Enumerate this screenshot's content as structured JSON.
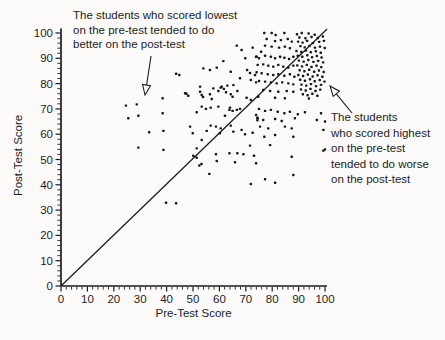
{
  "figure": {
    "background": "#fcfbfa",
    "ink_color": "#1c1c1c",
    "dot_color": "#161616"
  },
  "annotations": {
    "left": {
      "lines": [
        "The students who scored lowest",
        "on the pre-test tended to do",
        "better on the post-test"
      ],
      "arrow_icon": "open-arrowhead-down-left"
    },
    "right": {
      "lines": [
        "The students",
        "who scored highest",
        "on the pre-test",
        "tended to do worse",
        "on the post-test"
      ],
      "arrow_icon": "open-arrowhead-up-left"
    }
  },
  "chart_data": {
    "type": "scatter",
    "title": "",
    "xlabel": "Pre-Test Score",
    "ylabel": "Post-Test Score",
    "xlim": [
      0,
      100
    ],
    "ylim": [
      0,
      100
    ],
    "x_ticks": [
      0,
      10,
      20,
      30,
      40,
      50,
      60,
      70,
      80,
      90,
      100
    ],
    "y_ticks": [
      0,
      10,
      20,
      30,
      40,
      50,
      60,
      70,
      80,
      90,
      100
    ],
    "minor_tick_step": 2,
    "grid": false,
    "legend": "none",
    "identity_line": {
      "from": [
        0,
        0
      ],
      "to": [
        100.8,
        101.6
      ]
    },
    "points": [
      [
        66.6,
        95
      ],
      [
        68.4,
        93.3
      ],
      [
        72.6,
        94.2
      ],
      [
        61.5,
        88.9
      ],
      [
        69.8,
        90
      ],
      [
        73.9,
        90.6
      ],
      [
        53.9,
        86
      ],
      [
        56.4,
        85.4
      ],
      [
        59,
        86.3
      ],
      [
        64.3,
        84.7
      ],
      [
        70.5,
        85.4
      ],
      [
        71.6,
        84.2
      ],
      [
        73.5,
        83.4
      ],
      [
        67.8,
        82.1
      ],
      [
        71.9,
        81.4
      ],
      [
        73.9,
        80.5
      ],
      [
        52.7,
        78.8
      ],
      [
        57.7,
        78.1
      ],
      [
        60.9,
        78.8
      ],
      [
        63,
        79.2
      ],
      [
        65.3,
        79.4
      ],
      [
        47,
        76.2
      ],
      [
        52.7,
        76.8
      ],
      [
        44.8,
        83.4
      ],
      [
        43.6,
        83.9
      ],
      [
        28.7,
        71.8
      ],
      [
        24.6,
        71.3
      ],
      [
        38.5,
        74.2
      ],
      [
        47.5,
        76
      ],
      [
        48.2,
        75.2
      ],
      [
        53.3,
        75.5
      ],
      [
        53.8,
        74.7
      ],
      [
        56.4,
        75.8
      ],
      [
        59.6,
        77.1
      ],
      [
        60.5,
        78.4
      ],
      [
        61.7,
        77.9
      ],
      [
        62.5,
        76.6
      ],
      [
        64.3,
        75.8
      ],
      [
        65,
        74.8
      ],
      [
        66.8,
        77.1
      ],
      [
        25.5,
        66.3
      ],
      [
        29.3,
        67.3
      ],
      [
        38.5,
        68.3
      ],
      [
        51.4,
        68.7
      ],
      [
        54.9,
        70
      ],
      [
        56.7,
        70.5
      ],
      [
        59.6,
        70.9
      ],
      [
        64,
        70.5
      ],
      [
        66.6,
        69.6
      ],
      [
        33.4,
        60.8
      ],
      [
        38.8,
        61.3
      ],
      [
        49.9,
        60.4
      ],
      [
        55.2,
        61.3
      ],
      [
        60.2,
        60.4
      ],
      [
        65.3,
        61
      ],
      [
        29.3,
        54.7
      ],
      [
        38.8,
        53.8
      ],
      [
        51.4,
        54.4
      ],
      [
        66.8,
        52.5
      ],
      [
        52.4,
        47.6
      ],
      [
        53.2,
        48.2
      ],
      [
        59,
        49.4
      ],
      [
        65.9,
        48.9
      ],
      [
        57.1,
        73.9
      ],
      [
        70.3,
        74.4
      ],
      [
        71.9,
        73.5
      ],
      [
        53.3,
        70.9
      ],
      [
        63.8,
        69.6
      ],
      [
        65,
        69.2
      ],
      [
        67.8,
        70
      ],
      [
        62.1,
        67.3
      ],
      [
        48.9,
        63
      ],
      [
        56.7,
        63.4
      ],
      [
        58.7,
        63
      ],
      [
        60.5,
        62.3
      ],
      [
        64.3,
        63.4
      ],
      [
        68.4,
        61.7
      ],
      [
        69.7,
        60
      ],
      [
        72.6,
        60.6
      ],
      [
        53.3,
        57.7
      ],
      [
        71.6,
        55.5
      ],
      [
        58.7,
        52.1
      ],
      [
        63.8,
        52.5
      ],
      [
        69.1,
        52.1
      ],
      [
        73.1,
        51.5
      ],
      [
        50.1,
        51.5
      ],
      [
        51.4,
        50.7
      ],
      [
        73.9,
        48.5
      ],
      [
        56.2,
        44.3
      ],
      [
        39.8,
        32.9
      ],
      [
        43.6,
        32.7
      ],
      [
        71.9,
        40.3
      ],
      [
        77.3,
        42.2
      ],
      [
        81.1,
        40.8
      ],
      [
        88,
        43.9
      ],
      [
        75,
        70
      ],
      [
        77.3,
        69.2
      ],
      [
        79.5,
        69.6
      ],
      [
        82.1,
        68.9
      ],
      [
        84.6,
        68.3
      ],
      [
        86.7,
        68.9
      ],
      [
        89.7,
        67.9
      ],
      [
        92.4,
        68.7
      ],
      [
        74.5,
        66.3
      ],
      [
        76.6,
        65.6
      ],
      [
        81.1,
        66
      ],
      [
        83.6,
        65.2
      ],
      [
        88.6,
        66.3
      ],
      [
        96.9,
        65.6
      ],
      [
        100,
        65
      ],
      [
        75.4,
        63
      ],
      [
        78.5,
        62.3
      ],
      [
        84.8,
        63
      ],
      [
        87.4,
        62.3
      ],
      [
        99.4,
        61.7
      ],
      [
        77,
        59
      ],
      [
        81.1,
        59.7
      ],
      [
        88,
        59
      ],
      [
        79.2,
        55.7
      ],
      [
        87.4,
        51.1
      ],
      [
        98.5,
        68.3
      ],
      [
        99.4,
        53.5
      ],
      [
        100,
        54
      ],
      [
        73.9,
        67.6
      ],
      [
        74.4,
        66.5
      ],
      [
        74.4,
        65.5
      ],
      [
        79.8,
        100
      ],
      [
        84.6,
        100
      ],
      [
        77,
        100
      ],
      [
        81.3,
        99.2
      ],
      [
        77.9,
        97.6
      ],
      [
        81.1,
        96.8
      ],
      [
        83.3,
        97.2
      ],
      [
        85.9,
        97.6
      ],
      [
        87.4,
        96.6
      ],
      [
        77.3,
        95
      ],
      [
        79.8,
        94.6
      ],
      [
        82.6,
        94.2
      ],
      [
        84.8,
        94.6
      ],
      [
        86.7,
        94
      ],
      [
        75.8,
        92.6
      ],
      [
        74.1,
        90.6
      ],
      [
        75,
        90
      ],
      [
        77.3,
        91
      ],
      [
        79.5,
        90.6
      ],
      [
        81.1,
        90
      ],
      [
        83,
        90.6
      ],
      [
        84.6,
        90.2
      ],
      [
        86.4,
        89.7
      ],
      [
        88,
        90.6
      ],
      [
        74.5,
        87.4
      ],
      [
        76.6,
        87.6
      ],
      [
        78.5,
        87.1
      ],
      [
        80.4,
        86.7
      ],
      [
        82.3,
        87.4
      ],
      [
        84.2,
        86.7
      ],
      [
        86.1,
        86.3
      ],
      [
        88,
        87.1
      ],
      [
        74.1,
        84.5
      ],
      [
        76,
        84.1
      ],
      [
        78.3,
        83.7
      ],
      [
        80.4,
        83.4
      ],
      [
        82.3,
        83.7
      ],
      [
        84.6,
        83.1
      ],
      [
        86.7,
        83.7
      ],
      [
        88.4,
        82.7
      ],
      [
        75,
        81
      ],
      [
        77.3,
        80.8
      ],
      [
        79.5,
        80.5
      ],
      [
        81.7,
        80.1
      ],
      [
        83.8,
        80.5
      ],
      [
        86.1,
        80.1
      ],
      [
        88,
        79.7
      ],
      [
        76.6,
        77.5
      ],
      [
        79.2,
        77.1
      ],
      [
        82.3,
        76.8
      ],
      [
        85.5,
        77.1
      ],
      [
        88,
        76.8
      ],
      [
        74.7,
        74.8
      ],
      [
        81.1,
        74.4
      ],
      [
        84.8,
        74.2
      ],
      [
        89.4,
        99.5
      ],
      [
        91.2,
        100
      ],
      [
        93.8,
        99.8
      ],
      [
        96.1,
        99.3
      ],
      [
        90.3,
        98.2
      ],
      [
        92.6,
        97.9
      ],
      [
        94.9,
        98.4
      ],
      [
        97.3,
        98
      ],
      [
        99.2,
        98.6
      ],
      [
        89.8,
        96.6
      ],
      [
        91.5,
        96.2
      ],
      [
        93.2,
        96.9
      ],
      [
        95.4,
        96
      ],
      [
        97.8,
        96.5
      ],
      [
        99.6,
        96.9
      ],
      [
        90.7,
        94.8
      ],
      [
        92.3,
        94.3
      ],
      [
        94.1,
        94.9
      ],
      [
        96.2,
        94.2
      ],
      [
        98.1,
        94.6
      ],
      [
        99.9,
        94.1
      ],
      [
        89.2,
        92.9
      ],
      [
        91,
        92.5
      ],
      [
        92.8,
        93.1
      ],
      [
        94.6,
        92.4
      ],
      [
        96.5,
        92.8
      ],
      [
        98.4,
        92.2
      ],
      [
        89.7,
        91
      ],
      [
        91.4,
        90.6
      ],
      [
        93.3,
        91.2
      ],
      [
        95.1,
        90.4
      ],
      [
        96.9,
        90.9
      ],
      [
        98.7,
        90.3
      ],
      [
        90.1,
        89.1
      ],
      [
        91.9,
        88.7
      ],
      [
        93.7,
        89.3
      ],
      [
        95.6,
        88.6
      ],
      [
        97.4,
        89
      ],
      [
        99.3,
        88.4
      ],
      [
        89.5,
        87.2
      ],
      [
        91.3,
        86.8
      ],
      [
        93.1,
        87.4
      ],
      [
        94.9,
        86.6
      ],
      [
        96.8,
        87.1
      ],
      [
        98.6,
        86.5
      ],
      [
        90.4,
        85.3
      ],
      [
        92.2,
        84.9
      ],
      [
        94,
        85.5
      ],
      [
        95.9,
        84.7
      ],
      [
        97.7,
        85.2
      ],
      [
        99.5,
        84.6
      ],
      [
        89.9,
        83.4
      ],
      [
        91.7,
        83
      ],
      [
        93.5,
        83.6
      ],
      [
        95.3,
        82.8
      ],
      [
        97.2,
        83.3
      ],
      [
        99,
        82.7
      ],
      [
        90.6,
        81.5
      ],
      [
        92.4,
        81.1
      ],
      [
        94.3,
        81.7
      ],
      [
        96.1,
        80.9
      ],
      [
        98,
        81.4
      ],
      [
        99.8,
        80.8
      ],
      [
        91.1,
        79.6
      ],
      [
        92.9,
        79.2
      ],
      [
        94.7,
        79.8
      ],
      [
        96.6,
        79
      ],
      [
        98.5,
        79.5
      ],
      [
        90.9,
        77.7
      ],
      [
        92.7,
        77.3
      ],
      [
        94.5,
        77.9
      ],
      [
        96.4,
        77.1
      ],
      [
        98.2,
        77.6
      ],
      [
        91.6,
        75.8
      ],
      [
        93.4,
        75.4
      ],
      [
        95.2,
        76
      ],
      [
        97.1,
        75.2
      ],
      [
        93.9,
        74.1
      ]
    ]
  }
}
